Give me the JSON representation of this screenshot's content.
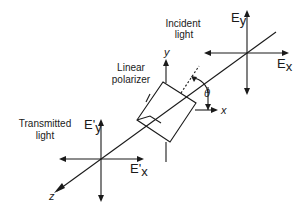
{
  "diagram": {
    "labels": {
      "incident_light_line1": "Incident",
      "incident_light_line2": "light",
      "polarizer_line1": "Linear",
      "polarizer_line2": "polarizer",
      "transmitted_line1": "Transmitted",
      "transmitted_line2": "light",
      "ey": "E",
      "ey_sub": "y",
      "ex": "E",
      "ex_sub": "x",
      "ey_prime": "E'",
      "ey_prime_sub": "y",
      "ex_prime": "E'",
      "ex_prime_sub": "x",
      "y_axis": "y",
      "x_axis": "x",
      "z_axis": "z",
      "theta": "θ"
    }
  }
}
